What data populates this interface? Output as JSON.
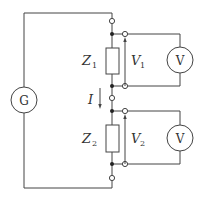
{
  "diagram": {
    "type": "circuit",
    "generator": {
      "label": "G"
    },
    "impedances": [
      {
        "symbol": "Z",
        "subscript": "1"
      },
      {
        "symbol": "Z",
        "subscript": "2"
      }
    ],
    "voltages": [
      {
        "symbol": "V",
        "subscript": "1"
      },
      {
        "symbol": "V",
        "subscript": "2"
      }
    ],
    "voltmeters": [
      {
        "label": "V"
      },
      {
        "label": "V"
      }
    ],
    "current": {
      "symbol": "I"
    },
    "colors": {
      "wire": "#444444",
      "background": "#ffffff"
    }
  }
}
